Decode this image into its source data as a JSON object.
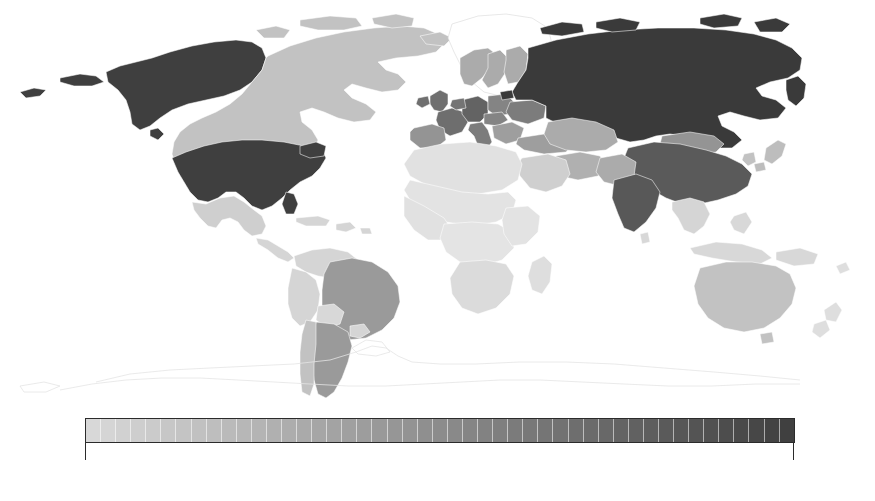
{
  "figure": {
    "type": "choropleth-world-map",
    "background_color": "#ffffff",
    "projection": "robinson"
  },
  "legend": {
    "orientation": "horizontal",
    "min_label": "0",
    "max_label": "251",
    "min_value": 0,
    "max_value": 251,
    "segments": 47,
    "low_color": "#d8d8d8",
    "high_color": "#404040",
    "border_color": "#2b2b2b",
    "tick_color": "#2b2b2b"
  },
  "chart_data": {
    "type": "heatmap",
    "title": "",
    "xlabel": "",
    "ylabel": "",
    "colorbar": {
      "label": "",
      "ticks": [
        0,
        251
      ],
      "tick_labels": [
        "0",
        "251"
      ],
      "range": [
        0,
        251
      ],
      "colormap": "grays",
      "discrete_segments": 47
    },
    "legend_position": "bottom",
    "grid": false,
    "regions": [
      {
        "name": "United States of America",
        "value": 240,
        "color": "#3f3f3f"
      },
      {
        "name": "Alaska (United States)",
        "value": 240,
        "color": "#3f3f3f"
      },
      {
        "name": "Russia",
        "value": 251,
        "color": "#3a3a3a"
      },
      {
        "name": "China",
        "value": 205,
        "color": "#5a5a5a"
      },
      {
        "name": "India",
        "value": 200,
        "color": "#585858"
      },
      {
        "name": "Germany",
        "value": 185,
        "color": "#636363"
      },
      {
        "name": "France",
        "value": 170,
        "color": "#6e6e6e"
      },
      {
        "name": "United Kingdom",
        "value": 168,
        "color": "#6f6f6f"
      },
      {
        "name": "Italy",
        "value": 150,
        "color": "#7c7c7c"
      },
      {
        "name": "Spain",
        "value": 120,
        "color": "#949494"
      },
      {
        "name": "Poland",
        "value": 145,
        "color": "#808080"
      },
      {
        "name": "Ukraine",
        "value": 150,
        "color": "#7c7c7c"
      },
      {
        "name": "Netherlands",
        "value": 160,
        "color": "#747474"
      },
      {
        "name": "Belgium",
        "value": 158,
        "color": "#757575"
      },
      {
        "name": "Switzerland",
        "value": 150,
        "color": "#7c7c7c"
      },
      {
        "name": "Austria",
        "value": 140,
        "color": "#848484"
      },
      {
        "name": "Czechia",
        "value": 140,
        "color": "#848484"
      },
      {
        "name": "Sweden",
        "value": 100,
        "color": "#a6a6a6"
      },
      {
        "name": "Norway",
        "value": 95,
        "color": "#ababab"
      },
      {
        "name": "Finland",
        "value": 95,
        "color": "#ababab"
      },
      {
        "name": "Turkey",
        "value": 110,
        "color": "#9e9e9e"
      },
      {
        "name": "Kazakhstan",
        "value": 95,
        "color": "#ababab"
      },
      {
        "name": "Mongolia",
        "value": 120,
        "color": "#949494"
      },
      {
        "name": "Iran",
        "value": 90,
        "color": "#b0b0b0"
      },
      {
        "name": "Saudi Arabia",
        "value": 55,
        "color": "#cfcfcf"
      },
      {
        "name": "Japan",
        "value": 75,
        "color": "#bdbdbd"
      },
      {
        "name": "Canada",
        "value": 70,
        "color": "#c2c2c2"
      },
      {
        "name": "Mexico",
        "value": 55,
        "color": "#cfcfcf"
      },
      {
        "name": "Brazil",
        "value": 115,
        "color": "#9a9a9a"
      },
      {
        "name": "Argentina",
        "value": 115,
        "color": "#9a9a9a"
      },
      {
        "name": "Chile",
        "value": 70,
        "color": "#c2c2c2"
      },
      {
        "name": "Colombia",
        "value": 45,
        "color": "#d5d5d5"
      },
      {
        "name": "Peru",
        "value": 45,
        "color": "#d5d5d5"
      },
      {
        "name": "Venezuela",
        "value": 45,
        "color": "#d5d5d5"
      },
      {
        "name": "Bolivia",
        "value": 40,
        "color": "#d8d8d8"
      },
      {
        "name": "Australia",
        "value": 70,
        "color": "#c2c2c2"
      },
      {
        "name": "New Zealand",
        "value": 30,
        "color": "#dedede"
      },
      {
        "name": "South Africa",
        "value": 35,
        "color": "#dbdbdb"
      },
      {
        "name": "Egypt",
        "value": 30,
        "color": "#dedede"
      },
      {
        "name": "Nigeria",
        "value": 25,
        "color": "#e1e1e1"
      },
      {
        "name": "Algeria",
        "value": 25,
        "color": "#e1e1e1"
      },
      {
        "name": "Libya",
        "value": 20,
        "color": "#e3e3e3"
      },
      {
        "name": "Sudan",
        "value": 20,
        "color": "#e3e3e3"
      },
      {
        "name": "Democratic Republic of the Congo",
        "value": 18,
        "color": "#e4e4e4"
      },
      {
        "name": "Indonesia",
        "value": 40,
        "color": "#d8d8d8"
      },
      {
        "name": "Greenland",
        "value": null,
        "color": "#ffffff"
      },
      {
        "name": "Antarctica",
        "value": null,
        "color": "#ffffff"
      }
    ]
  }
}
